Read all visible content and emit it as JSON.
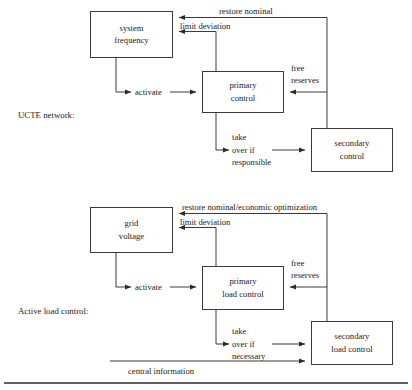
{
  "figure": {
    "kind": "block-diagram",
    "width": 412,
    "height": 390,
    "line_color": "#3a3a3a",
    "text_color": "#1a1a1a",
    "background": "#ffffff"
  },
  "sections": {
    "upper": {
      "label": "UCTE network:",
      "boxes": {
        "source": {
          "line1": "system",
          "line2": "frequency"
        },
        "primary": {
          "line1": "primary",
          "line2": "control"
        },
        "secondary": {
          "line1": "secondary",
          "line2": "control"
        }
      },
      "edges": {
        "restore": "restore nominal",
        "limit": "limit deviation",
        "activate": "activate",
        "free_reserves_line1": "free",
        "free_reserves_line2": "reserves",
        "takeover_line1": "take",
        "takeover_line2": "over if",
        "takeover_line3": "responsible"
      }
    },
    "lower": {
      "label": "Active load control:",
      "boxes": {
        "source": {
          "line1": "grid",
          "line2": "voltage"
        },
        "primary": {
          "line1": "primary",
          "line2": "load control"
        },
        "secondary": {
          "line1": "secondary",
          "line2": "load control"
        }
      },
      "edges": {
        "restore": "restore nominal/economic optimization",
        "limit": "limit deviation",
        "activate": "activate",
        "free_reserves_line1": "free",
        "free_reserves_line2": "reserves",
        "takeover_line1": "take",
        "takeover_line2": "over if",
        "takeover_line3": "necessary",
        "central": "central information"
      }
    }
  }
}
